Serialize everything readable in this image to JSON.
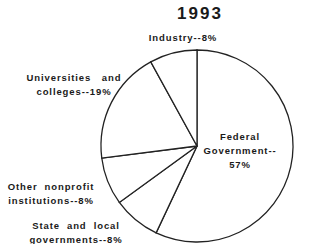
{
  "chart_data": {
    "type": "pie",
    "title": "1993",
    "start_angle_deg": 0,
    "direction": "clockwise",
    "slices": [
      {
        "label": "Federal Government",
        "value": 57,
        "label_lines": [
          "Federal",
          "Government--",
          "57%"
        ]
      },
      {
        "label": "State and local governments",
        "value": 8,
        "label_lines": [
          "State  and  local",
          "governments--8%"
        ]
      },
      {
        "label": "Other nonprofit institutions",
        "value": 8,
        "label_lines": [
          "Other  nonprofit",
          "institutions--8%"
        ]
      },
      {
        "label": "Universities and colleges",
        "value": 19,
        "label_lines": [
          "Universities   and",
          "colleges--19%"
        ]
      },
      {
        "label": "Industry",
        "value": 8,
        "label_lines": [
          "Industry--8%"
        ]
      }
    ],
    "unit": "%",
    "colors": {
      "fill": "#ffffff",
      "stroke": "#222222",
      "text": "#1a1a1a"
    }
  },
  "layout": {
    "cx": 197,
    "cy": 146,
    "r": 96,
    "title_pos": [
      200,
      19
    ],
    "label_positions": [
      {
        "x": 240,
        "y": 140,
        "anchor": "middle"
      },
      {
        "x": 76,
        "y": 229,
        "anchor": "middle"
      },
      {
        "x": 51,
        "y": 190,
        "anchor": "middle"
      },
      {
        "x": 74,
        "y": 81,
        "anchor": "middle"
      },
      {
        "x": 183,
        "y": 41,
        "anchor": "middle"
      }
    ],
    "line_height": 14
  }
}
